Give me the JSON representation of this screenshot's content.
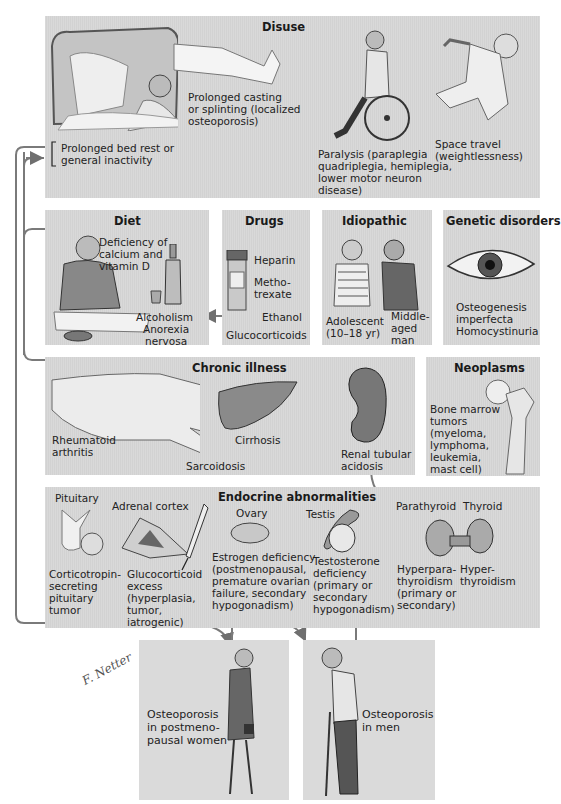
{
  "diagram": {
    "line_color": "#7a7a7a",
    "panel_color": "#d6d6d6"
  },
  "disuse": {
    "title": "Disuse",
    "bed_rest": "Prolonged bed rest or\ngeneral inactivity",
    "casting": "Prolonged casting\nor splinting (localized\nosteoporosis)",
    "paralysis": "Paralysis (paraplegia\nquadriplegia, hemiplegia,\nlower motor neuron\ndisease)",
    "space": "Space travel\n(weightlessness)"
  },
  "diet": {
    "title": "Diet",
    "deficiency": "Deficiency of\ncalcium and\nvitamin D",
    "alcoholism": "Alcoholism",
    "anorexia": "Anorexia\nnervosa"
  },
  "drugs": {
    "title": "Drugs",
    "items": [
      "Heparin",
      "Metho-\ntrexate",
      "Ethanol",
      "Glucocorticoids"
    ]
  },
  "idiopathic": {
    "title": "Idiopathic",
    "adolescent": "Adolescent\n(10–18 yr)",
    "middle_aged": "Middle-\naged\nman"
  },
  "genetic": {
    "title": "Genetic disorders",
    "items": "Osteogenesis\nimperfecta\nHomocystinuria"
  },
  "chronic": {
    "title": "Chronic illness",
    "ra": "Rheumatoid\narthritis",
    "sarcoidosis": "Sarcoidosis",
    "cirrhosis": "Cirrhosis",
    "rta": "Renal tubular\nacidosis"
  },
  "neoplasms": {
    "title": "Neoplasms",
    "text": "Bone marrow\ntumors\n(myeloma,\nlymphoma,\nleukemia,\nmast cell)"
  },
  "endocrine": {
    "title": "Endocrine abnormalities",
    "pituitary": "Pituitary",
    "pituitary_text": "Corticotropin-\nsecreting\npituitary\ntumor",
    "adrenal": "Adrenal cortex",
    "adrenal_text": "Glucocorticoid\nexcess\n(hyperplasia,\ntumor,\niatrogenic)",
    "ovary": "Ovary",
    "ovary_text": "Estrogen deficiency\n(postmenopausal,\npremature ovarian\nfailure, secondary\nhypogonadism)",
    "testis": "Testis",
    "testis_text": "Testosterone\ndeficiency\n(primary or\nsecondary\nhypogonadism)",
    "parathyroid": "Parathyroid",
    "parathyroid_text": "Hyperpara-\nthyroidism\n(primary or\nsecondary)",
    "thyroid": "Thyroid",
    "thyroid_text": "Hyper-\nthyroidism"
  },
  "outcomes": {
    "women": "Osteoporosis\nin postmeno-\npausal women",
    "men": "Osteoporosis\nin men"
  },
  "signature": "F. Netter"
}
